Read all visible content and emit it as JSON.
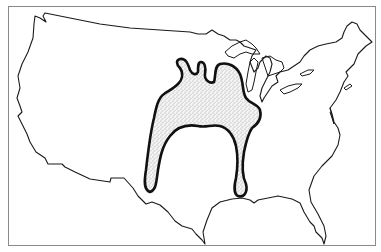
{
  "map": {
    "kind": "outline-map",
    "region": "contiguous United States",
    "colors": {
      "background": "#ffffff",
      "frame": "#8a8a8a",
      "outline": "#1a1a1a",
      "highlight_border": "#111111",
      "stipple": "#555555"
    },
    "layers": [
      {
        "name": "us-outline",
        "style": "thin black line"
      },
      {
        "name": "great-lakes",
        "style": "thin black line"
      },
      {
        "name": "highlighted-region",
        "style": "stippled fill with heavy black border"
      }
    ]
  }
}
